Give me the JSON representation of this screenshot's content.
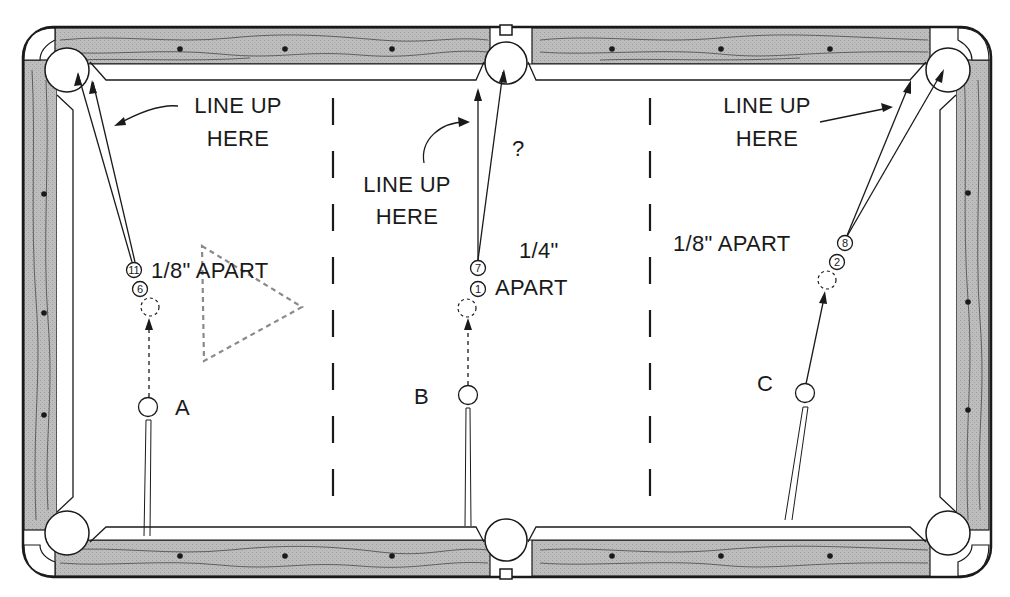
{
  "diagram": {
    "title_hint": "Pool table frozen-ball / combination shot illustration",
    "colors": {
      "rail_wood": "#b8b8b8",
      "ink": "#1a1a1a",
      "cloth": "#ffffff",
      "triangle_dashes": "#8a8a8a"
    },
    "scenarios": [
      {
        "id": "A",
        "label": "A",
        "callout": [
          "LINE UP",
          "HERE"
        ],
        "spacing_label": "1/8\" APART",
        "balls": [
          "11",
          "6"
        ],
        "target_pocket": "top-left corner"
      },
      {
        "id": "B",
        "label": "B",
        "callout": [
          "LINE UP",
          "HERE"
        ],
        "spacing_label_line1": "1/4\"",
        "spacing_label_line2": "APART",
        "question_mark": "?",
        "balls": [
          "7",
          "1"
        ],
        "target_pocket": "top side"
      },
      {
        "id": "C",
        "label": "C",
        "callout": [
          "LINE UP",
          "HERE"
        ],
        "spacing_label": "1/8\" APART",
        "balls": [
          "8",
          "2"
        ],
        "target_pocket": "top-right corner"
      }
    ],
    "rails": {
      "top_diamonds_x": [
        180,
        285,
        392,
        612,
        721,
        830
      ],
      "bottom_diamonds_x": [
        180,
        285,
        392,
        612,
        721,
        830
      ],
      "left_diamonds_y": [
        194,
        313,
        415
      ],
      "right_diamonds_y": [
        193,
        302,
        410
      ]
    },
    "pockets": [
      "top-left",
      "top-side",
      "top-right",
      "bottom-left",
      "bottom-side",
      "bottom-right"
    ],
    "dividers_x": [
      333,
      650
    ],
    "rack_triangle": "dashed outline"
  }
}
